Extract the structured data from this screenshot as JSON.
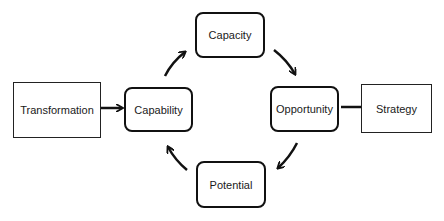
{
  "diagram": {
    "nodes": {
      "transformation": "Transformation",
      "capability": "Capability",
      "capacity": "Capacity",
      "opportunity": "Opportunity",
      "potential": "Potential",
      "strategy": "Strategy"
    },
    "edges": [
      {
        "from": "Transformation",
        "to": "Capability"
      },
      {
        "from": "Capability",
        "to": "Capacity"
      },
      {
        "from": "Capacity",
        "to": "Opportunity"
      },
      {
        "from": "Opportunity",
        "to": "Potential"
      },
      {
        "from": "Potential",
        "to": "Capability"
      },
      {
        "from": "Strategy",
        "to": "Opportunity"
      }
    ]
  }
}
